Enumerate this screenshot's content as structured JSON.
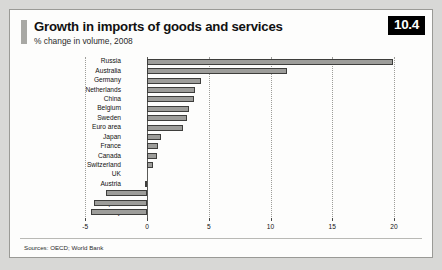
{
  "card": {
    "badge": "10.4",
    "title": "Growth in imports of goods and services",
    "subtitle": "% change in volume, 2008",
    "sources": "Sources: OECD; World Bank"
  },
  "colors": {
    "bar_fill": "#9d9d9a",
    "bar_border": "#3e3e3c",
    "badge_bg": "#000000",
    "badge_text": "#ffffff",
    "card_bg": "#fdfdfc",
    "page_bg": "#d8d8d6",
    "gridline": "#9d9d99",
    "accent": "#a8a8a4"
  },
  "chart_data": {
    "type": "bar",
    "orientation": "horizontal",
    "title": "Growth in imports of goods and services",
    "subtitle": "% change in volume, 2008",
    "xlabel": "",
    "ylabel": "",
    "xlim": [
      -5,
      20
    ],
    "xticks": [
      -5,
      0,
      5,
      10,
      15,
      20
    ],
    "xtick_labels": [
      "-5",
      "0",
      "5",
      "10",
      "15",
      "20"
    ],
    "grid": true,
    "legend": false,
    "categories": [
      "Russia",
      "Australia",
      "Germany",
      "Netherlands",
      "China",
      "Belgium",
      "Sweden",
      "Euro area",
      "Japan",
      "France",
      "Canada",
      "Switzerland",
      "UK",
      "Austria",
      "US",
      "Spain",
      "Italy"
    ],
    "values": [
      19.9,
      11.3,
      4.4,
      3.9,
      3.8,
      3.4,
      3.2,
      2.9,
      1.1,
      0.9,
      0.8,
      0.5,
      0.0,
      -0.2,
      -3.3,
      -4.3,
      -4.5
    ]
  }
}
